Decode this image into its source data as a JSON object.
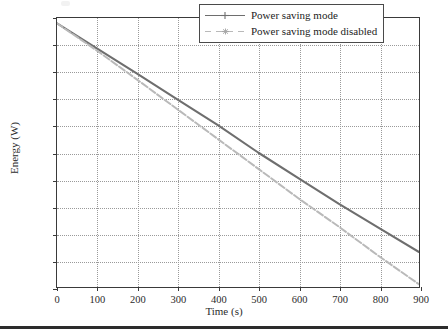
{
  "chart_data": {
    "type": "line",
    "title": "",
    "xlabel": "Time (s)",
    "ylabel": "Energy (W)",
    "xlim": [
      0,
      900
    ],
    "ylim": [
      900,
      1000
    ],
    "xticks": [
      0,
      100,
      200,
      300,
      400,
      500,
      600,
      700,
      800,
      900
    ],
    "yticks": [
      900,
      910,
      920,
      930,
      940,
      950,
      960,
      970,
      980,
      990,
      1000
    ],
    "grid": true,
    "grid_style": "dotted",
    "legend_position": "top-right",
    "x": [
      0,
      100,
      200,
      300,
      400,
      500,
      600,
      700,
      800,
      900
    ],
    "series": [
      {
        "name": "Power saving mode",
        "color": "#6e6e6e",
        "linestyle": "solid",
        "marker": "plus",
        "values": [
          998.0,
          988.6,
          979.2,
          969.7,
          960.2,
          950.0,
          940.5,
          931.0,
          922.0,
          913.0
        ]
      },
      {
        "name": "Power saving mode disabled",
        "color": "#b9b9b9",
        "linestyle": "dashed",
        "marker": "asterisk",
        "values": [
          998.0,
          987.8,
          977.0,
          966.0,
          955.0,
          944.0,
          933.0,
          922.5,
          911.5,
          901.0
        ]
      }
    ]
  },
  "axes": {
    "x_title": "Time (s)",
    "y_title": "Energy (W)",
    "x_tick_labels": [
      "0",
      "100",
      "200",
      "300",
      "400",
      "500",
      "600",
      "700",
      "800",
      "900"
    ],
    "y_tick_labels": [
      "900",
      "910",
      "920",
      "930",
      "940",
      "950",
      "960",
      "970",
      "980",
      "990",
      "1000"
    ]
  },
  "legend": {
    "entries": [
      {
        "label": "Power saving mode",
        "color": "#6e6e6e",
        "style": "solid"
      },
      {
        "label": "Power saving mode disabled",
        "color": "#b9b9b9",
        "style": "dashed"
      }
    ]
  },
  "colors": {
    "series_primary": "#6e6e6e",
    "series_secondary": "#b9b9b9",
    "axis": "#3a3a3a",
    "grid": "#9a9a9a",
    "text": "#2b2b2b",
    "rule": "#2c2c2c"
  }
}
